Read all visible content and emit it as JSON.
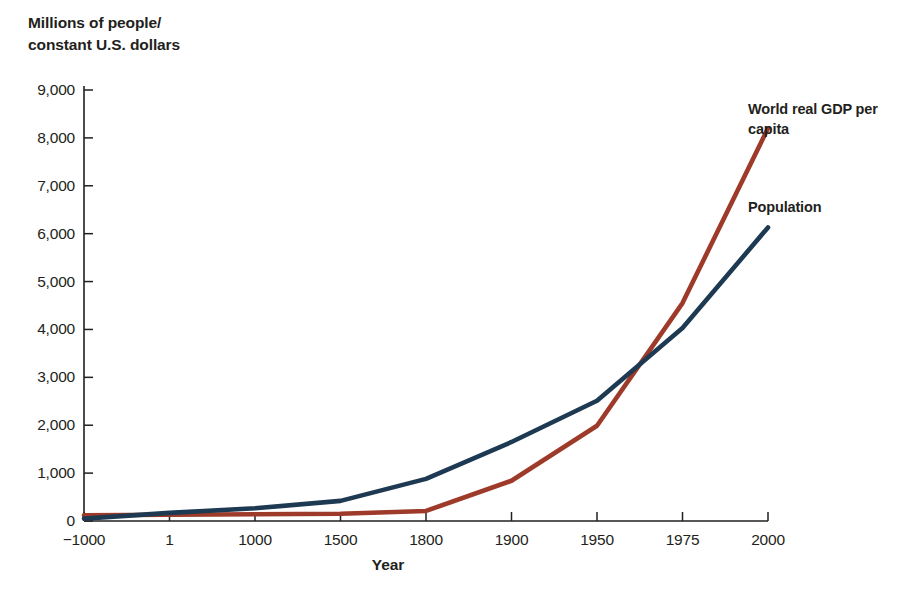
{
  "axis_title": {
    "y": "Millions of people/\nconstant U.S. dollars",
    "x": "Year"
  },
  "series_labels": {
    "gdp": "World real GDP per\ncapita",
    "population": "Population"
  },
  "colors": {
    "gdp_line": "#9d3a29",
    "population_line": "#1e3a52",
    "axis": "#231f20",
    "background": "#ffffff"
  },
  "chart_data": {
    "type": "line",
    "title": "",
    "xlabel": "Year",
    "ylabel": "Millions of people/constant U.S. dollars",
    "categories": [
      "-1000",
      "1",
      "1000",
      "1500",
      "1800",
      "1900",
      "1950",
      "1975",
      "2000"
    ],
    "x_tick_labels": [
      "−1000",
      "1",
      "1000",
      "1500",
      "1800",
      "1900",
      "1950",
      "1975",
      "2000"
    ],
    "y_tick_labels": [
      "0",
      "1,000",
      "2,000",
      "3,000",
      "4,000",
      "5,000",
      "6,000",
      "7,000",
      "8,000",
      "9,000"
    ],
    "y_tick_values": [
      0,
      1000,
      2000,
      3000,
      4000,
      5000,
      6000,
      7000,
      8000,
      9000
    ],
    "ylim": [
      0,
      9000
    ],
    "grid": false,
    "legend_position": "inline-right",
    "x_axis_scale": "ordinal",
    "series": [
      {
        "name": "World real GDP per capita",
        "color": "#9d3a29",
        "values": [
          120,
          130,
          140,
          150,
          210,
          840,
          1990,
          4550,
          8200
        ]
      },
      {
        "name": "Population",
        "color": "#1e3a52",
        "values": [
          50,
          170,
          265,
          420,
          880,
          1650,
          2510,
          4030,
          6130
        ]
      }
    ],
    "annotations": [
      {
        "text": "World real GDP per capita",
        "attached_to": "World real GDP per capita",
        "at_category": "2000"
      },
      {
        "text": "Population",
        "attached_to": "Population",
        "at_category": "2000"
      }
    ]
  }
}
